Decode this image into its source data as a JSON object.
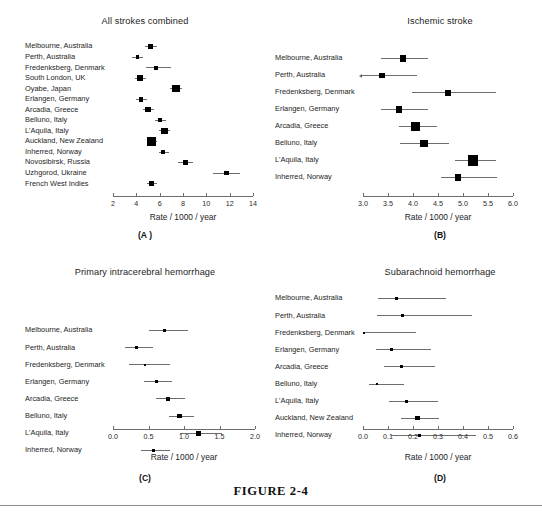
{
  "figure": {
    "caption": "FIGURE 2-4",
    "width": 542,
    "height": 516,
    "background": "#ffffff",
    "marker_color": "#000000",
    "ci_color": "#6d6d6d",
    "axis_color": "#6d6d6d"
  },
  "chart_data": [
    {
      "id": "A",
      "type": "scatter",
      "subtype": "forest-plot",
      "title": "All strokes combined",
      "letter": "(A )",
      "xlabel": "Rate / 1000 / year",
      "ylabel": "",
      "xlim": [
        2,
        14
      ],
      "xticks": [
        2,
        4,
        6,
        8,
        10,
        12,
        14
      ],
      "xticklabels": [
        "2",
        "4",
        "6",
        "8",
        "10",
        "12",
        "14"
      ],
      "grid": false,
      "legend": "none",
      "categories": [
        "Melbourne, Australia",
        "Perth, Australia",
        "Fredenksberg, Denmark",
        "South London, UK",
        "Oyabe, Japan",
        "Erlangen, Germany",
        "Arcadia, Greece",
        "Belluno, Italy",
        "L'Aquila, Italy",
        "Auckland, New Zealand",
        "Inherred, Norway",
        "Novosibirsk, Russia",
        "Uzhgorod, Ukraine",
        "French West Indies"
      ],
      "values": [
        5.2,
        4.1,
        5.7,
        4.3,
        7.4,
        4.4,
        5.0,
        6.0,
        6.4,
        5.3,
        6.3,
        8.2,
        11.7,
        5.3
      ],
      "ci_low": [
        4.7,
        3.6,
        4.8,
        3.9,
        6.9,
        4.0,
        4.6,
        5.6,
        5.9,
        4.9,
        5.9,
        7.6,
        10.6,
        4.9
      ],
      "ci_high": [
        5.8,
        4.6,
        7.0,
        4.8,
        7.9,
        4.9,
        5.5,
        6.5,
        6.9,
        5.8,
        6.8,
        8.9,
        12.9,
        5.8
      ],
      "marker_sizes": [
        4.5,
        3.8,
        4.1,
        5.6,
        7.6,
        4.8,
        5.2,
        4.3,
        6.4,
        9.2,
        4.3,
        4.6,
        4.8,
        5.0
      ]
    },
    {
      "id": "B",
      "type": "scatter",
      "subtype": "forest-plot",
      "title": "Ischemic stroke",
      "letter": "(B)",
      "xlabel": "Rate / 1000 / year",
      "ylabel": "",
      "xlim": [
        3.0,
        6.0
      ],
      "xticks": [
        3.0,
        3.5,
        4.0,
        4.5,
        5.0,
        5.5,
        6.0
      ],
      "xticklabels": [
        "3.0",
        "3.5",
        "4.0",
        "4.5",
        "5.0",
        "5.5",
        "6.0"
      ],
      "grid": false,
      "legend": "none",
      "categories": [
        "Melbourne, Australia",
        "Perth, Australia",
        "Fredenksberg, Denmark",
        "Erlangen, Germany",
        "Arcadia, Greece",
        "Belluno, Italy",
        "L'Aquila, Italy",
        "Inherred, Norway"
      ],
      "values": [
        3.8,
        3.38,
        4.69,
        3.72,
        4.05,
        4.22,
        5.2,
        4.9
      ],
      "ci_low": [
        3.35,
        2.97,
        3.97,
        3.36,
        3.71,
        3.73,
        4.83,
        4.55
      ],
      "ci_high": [
        4.29,
        4.07,
        5.66,
        4.3,
        4.48,
        4.71,
        5.66,
        5.67
      ],
      "ci_low_arrow": [
        false,
        true,
        false,
        false,
        false,
        false,
        false,
        false
      ],
      "marker_sizes": [
        6.4,
        5.8,
        6.0,
        6.2,
        8.6,
        7.6,
        10.4,
        6.6
      ]
    },
    {
      "id": "C",
      "type": "scatter",
      "subtype": "forest-plot",
      "title": "Primary intracerebral hemorrhage",
      "letter": "(C)",
      "xlabel": "Rate / 1000 / year",
      "ylabel": "",
      "xlim": [
        0.0,
        2.0
      ],
      "xticks": [
        0.0,
        0.5,
        1.0,
        1.5,
        2.0
      ],
      "xticklabels": [
        "0.0",
        "0.5",
        "1.0",
        "1.5",
        "2.0"
      ],
      "grid": false,
      "legend": "none",
      "categories": [
        "Melbourne, Australia",
        "Perth, Australia",
        "Fredenksberg, Denmark",
        "Erlangen, Germany",
        "Arcadia, Greece",
        "Belluno, Italy",
        "L'Aquila, Italy",
        "Inherred, Norway"
      ],
      "values": [
        0.72,
        0.33,
        0.45,
        0.61,
        0.77,
        0.94,
        1.2,
        0.57
      ],
      "ci_low": [
        0.5,
        0.17,
        0.23,
        0.43,
        0.61,
        0.79,
        0.94,
        0.4
      ],
      "ci_high": [
        1.05,
        0.56,
        0.8,
        0.83,
        1.02,
        1.14,
        1.53,
        0.8
      ],
      "marker_sizes": [
        2.8,
        2.6,
        2.2,
        3.2,
        3.8,
        4.6,
        5.0,
        3.2
      ]
    },
    {
      "id": "D",
      "type": "scatter",
      "subtype": "forest-plot",
      "title": "Subarachnoid hemorrhage",
      "letter": "(D)",
      "xlabel": "Rate / 1000 / year",
      "ylabel": "",
      "xlim": [
        0.0,
        0.6
      ],
      "xticks": [
        0.0,
        0.1,
        0.2,
        0.3,
        0.4,
        0.5,
        0.6
      ],
      "xticklabels": [
        "0.0",
        "0.1",
        "0.2",
        "0.3",
        "0.4",
        "0.5",
        "0.6"
      ],
      "grid": false,
      "legend": "none",
      "categories": [
        "Melbourne, Australia",
        "Perth, Australia",
        "Fredenksberg, Denmark",
        "Erlangen, Germany",
        "Arcadia, Greece",
        "Belluno, Italy",
        "L'Aquila, Italy",
        "Auckland, New Zealand",
        "Inherred, Norway"
      ],
      "values": [
        0.135,
        0.157,
        0.005,
        0.113,
        0.153,
        0.057,
        0.175,
        0.218,
        0.225
      ],
      "ci_low": [
        0.06,
        0.055,
        0.0,
        0.05,
        0.085,
        0.025,
        0.103,
        0.152,
        0.113
      ],
      "ci_high": [
        0.33,
        0.437,
        0.212,
        0.272,
        0.288,
        0.165,
        0.3,
        0.303,
        0.45
      ],
      "marker_sizes": [
        2.6,
        2.6,
        1.8,
        2.8,
        3.0,
        2.4,
        3.2,
        4.6,
        2.8
      ]
    }
  ]
}
